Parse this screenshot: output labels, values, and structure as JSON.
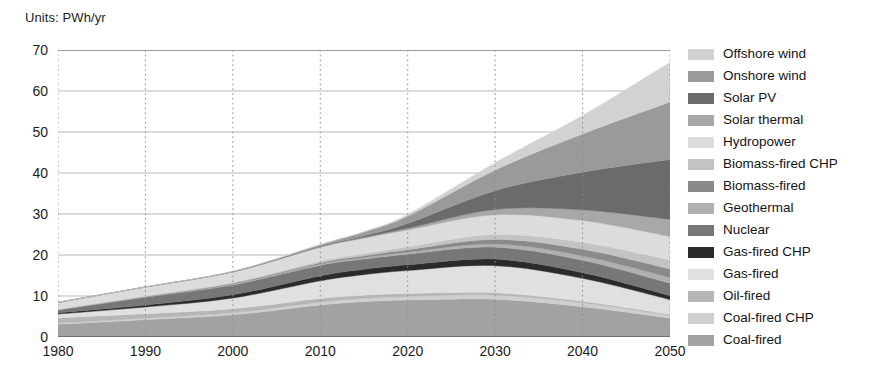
{
  "units_label": "Units: PWh/yr",
  "legend": {
    "position": "right",
    "items": [
      {
        "label": "Offshore wind",
        "color": "#d2d2d2"
      },
      {
        "label": "Onshore wind",
        "color": "#9a9a9a"
      },
      {
        "label": "Solar PV",
        "color": "#6b6b6b"
      },
      {
        "label": "Solar thermal",
        "color": "#a8a8a8"
      },
      {
        "label": "Hydropower",
        "color": "#dcdcdc"
      },
      {
        "label": "Biomass-fired CHP",
        "color": "#c3c3c3"
      },
      {
        "label": "Biomass-fired",
        "color": "#8a8a8a"
      },
      {
        "label": "Geothermal",
        "color": "#b0b0b0"
      },
      {
        "label": "Nuclear",
        "color": "#777777"
      },
      {
        "label": "Gas-fired CHP",
        "color": "#2b2b2b"
      },
      {
        "label": "Gas-fired",
        "color": "#e0e0e0"
      },
      {
        "label": "Oil-fired",
        "color": "#b6b6b6"
      },
      {
        "label": "Coal-fired CHP",
        "color": "#cfcfcf"
      },
      {
        "label": "Coal-fired",
        "color": "#a2a2a2"
      }
    ]
  },
  "chart_data": {
    "type": "area",
    "stacked": true,
    "title": "",
    "subtitle": "",
    "xlabel": "",
    "ylabel": "",
    "units": "PWh/yr",
    "xlim": [
      1980,
      2050
    ],
    "ylim": [
      0,
      70
    ],
    "xticks": [
      1980,
      1990,
      2000,
      2010,
      2020,
      2030,
      2040,
      2050
    ],
    "yticks": [
      0,
      10,
      20,
      30,
      40,
      50,
      60,
      70
    ],
    "grid": {
      "horizontal": true,
      "vertical": true,
      "horizontal_style": "solid",
      "vertical_style": "dotted"
    },
    "legend_position": "right",
    "x": [
      1980,
      1990,
      2000,
      2010,
      2015,
      2020,
      2030,
      2040,
      2050
    ],
    "stack_order_bottom_to_top": [
      "Coal-fired",
      "Coal-fired CHP",
      "Oil-fired",
      "Gas-fired",
      "Gas-fired CHP",
      "Nuclear",
      "Geothermal",
      "Biomass-fired",
      "Biomass-fired CHP",
      "Hydropower",
      "Solar thermal",
      "Solar PV",
      "Onshore wind",
      "Offshore wind"
    ],
    "series": [
      {
        "name": "Coal-fired",
        "color": "#a2a2a2",
        "values": [
          3.1,
          4.2,
          5.4,
          7.8,
          8.6,
          9.0,
          9.2,
          7.4,
          4.6
        ]
      },
      {
        "name": "Coal-fired CHP",
        "color": "#cfcfcf",
        "values": [
          0.3,
          0.4,
          0.5,
          0.7,
          0.8,
          0.9,
          1.0,
          0.9,
          0.7
        ]
      },
      {
        "name": "Oil-fired",
        "color": "#b6b6b6",
        "values": [
          1.3,
          1.1,
          1.0,
          0.9,
          0.8,
          0.7,
          0.6,
          0.4,
          0.2
        ]
      },
      {
        "name": "Gas-fired",
        "color": "#e0e0e0",
        "values": [
          0.9,
          1.6,
          2.6,
          4.3,
          5.0,
          5.6,
          6.6,
          5.6,
          3.6
        ]
      },
      {
        "name": "Gas-fired CHP",
        "color": "#2b2b2b",
        "values": [
          0.3,
          0.5,
          0.8,
          1.2,
          1.3,
          1.4,
          1.6,
          1.4,
          1.0
        ]
      },
      {
        "name": "Nuclear",
        "color": "#777777",
        "values": [
          0.7,
          1.9,
          2.4,
          2.6,
          2.5,
          2.6,
          2.9,
          3.0,
          3.0
        ]
      },
      {
        "name": "Geothermal",
        "color": "#b0b0b0",
        "values": [
          0.05,
          0.1,
          0.2,
          0.3,
          0.4,
          0.5,
          0.8,
          1.1,
          1.4
        ]
      },
      {
        "name": "Biomass-fired",
        "color": "#8a8a8a",
        "values": [
          0.05,
          0.1,
          0.2,
          0.3,
          0.4,
          0.6,
          1.1,
          1.6,
          2.1
        ]
      },
      {
        "name": "Biomass-fired CHP",
        "color": "#c3c3c3",
        "values": [
          0.05,
          0.1,
          0.2,
          0.4,
          0.5,
          0.7,
          1.2,
          1.7,
          2.2
        ]
      },
      {
        "name": "Hydropower",
        "color": "#dcdcdc",
        "values": [
          1.7,
          2.2,
          2.6,
          3.4,
          3.8,
          4.1,
          4.8,
          5.3,
          5.7
        ]
      },
      {
        "name": "Solar thermal",
        "color": "#a8a8a8",
        "values": [
          0.0,
          0.0,
          0.0,
          0.1,
          0.2,
          0.4,
          1.3,
          2.6,
          4.2
        ]
      },
      {
        "name": "Solar PV",
        "color": "#6b6b6b",
        "values": [
          0.0,
          0.0,
          0.0,
          0.1,
          0.4,
          1.2,
          4.6,
          9.2,
          14.6
        ]
      },
      {
        "name": "Onshore wind",
        "color": "#9a9a9a",
        "values": [
          0.0,
          0.0,
          0.1,
          0.4,
          0.9,
          1.8,
          5.0,
          9.3,
          14.0
        ]
      },
      {
        "name": "Offshore wind",
        "color": "#d2d2d2",
        "values": [
          0.0,
          0.0,
          0.0,
          0.05,
          0.15,
          0.4,
          1.8,
          4.5,
          9.7
        ]
      }
    ],
    "totals": [
      8.5,
      12.2,
      16.0,
      22.55,
      25.75,
      29.9,
      42.5,
      54.0,
      67.0
    ]
  }
}
